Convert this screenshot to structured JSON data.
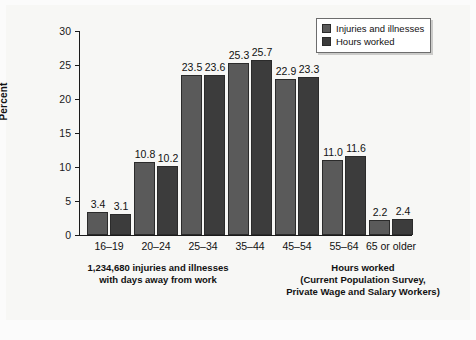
{
  "chart_data": {
    "type": "bar",
    "title": "",
    "subtitle": "",
    "xlabel": "",
    "ylabel": "Percent",
    "ylim": [
      0,
      30
    ],
    "yticks": [
      0,
      5,
      10,
      15,
      20,
      25,
      30
    ],
    "ytick_labels": [
      "0",
      "5",
      "10",
      "15",
      "20",
      "25",
      "30"
    ],
    "grid": false,
    "legend_position": "top-right",
    "categories": [
      "16–19",
      "20–24",
      "25–34",
      "35–44",
      "45–54",
      "55–64",
      "65 or older"
    ],
    "series": [
      {
        "name": "Injuries and illnesses",
        "color": "#5a5a5a",
        "values": [
          3.4,
          10.8,
          23.5,
          25.3,
          22.9,
          11.0,
          2.2
        ],
        "labels": [
          "3.4",
          "10.8",
          "23.5",
          "25.3",
          "22.9",
          "11.0",
          "2.2"
        ]
      },
      {
        "name": "Hours worked",
        "color": "#3c3c3c",
        "values": [
          3.1,
          10.2,
          23.6,
          25.7,
          23.3,
          11.6,
          2.4
        ],
        "labels": [
          "3.1",
          "10.2",
          "23.6",
          "25.7",
          "23.3",
          "11.6",
          "2.4"
        ]
      }
    ],
    "annotations": [
      "1,234,680 injuries and illnesses with days away from work",
      "Hours worked (Current Population Survey, Private Wage and Salary Workers)"
    ]
  },
  "legend": {
    "items": [
      {
        "label": "Injuries and illnesses",
        "color": "#5a5a5a"
      },
      {
        "label": "Hours worked",
        "color": "#3c3c3c"
      }
    ]
  },
  "captions": {
    "left": {
      "line1": "1,234,680 injuries and illnesses",
      "line2": "with days away from work"
    },
    "right": {
      "line1": "Hours worked",
      "line2": "(Current Population Survey,",
      "line3": "Private Wage and Salary Workers)"
    }
  },
  "colors": {
    "series_injuries": "#5a5a5a",
    "series_hours": "#3c3c3c",
    "axis": "#1a1a1a",
    "text": "#111111",
    "background": "#f7f7f5"
  }
}
